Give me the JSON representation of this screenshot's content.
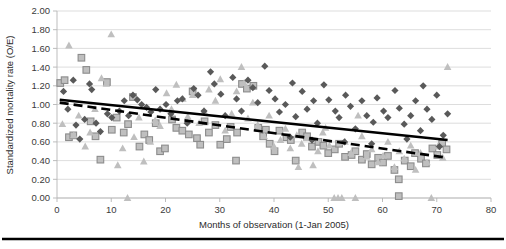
{
  "chart_data": {
    "type": "scatter",
    "title": "",
    "xlabel": "Months of observation (1-Jan 2005)",
    "ylabel": "Standardized mortality rate (O/E)",
    "xlim": [
      0,
      80
    ],
    "ylim": [
      0,
      2.0
    ],
    "xticks": [
      0,
      10,
      20,
      30,
      40,
      50,
      60,
      70,
      80
    ],
    "xtick_labels": [
      "0",
      "10",
      "20",
      "30",
      "40",
      "50",
      "60",
      "70",
      "80"
    ],
    "yticks": [
      0.0,
      0.2,
      0.4,
      0.6,
      0.8,
      1.0,
      1.2,
      1.4,
      1.6,
      1.8,
      2.0
    ],
    "ytick_labels": [
      "0.00",
      "0.20",
      "0.40",
      "0.60",
      "0.80",
      "1.00",
      "1.20",
      "1.40",
      "1.60",
      "1.80",
      "2.00"
    ],
    "grid": "horizontal",
    "legend": "none",
    "colors": {
      "diamond_fill": "#595959",
      "square_fill": "#bfbfbf",
      "square_stroke": "#8c8c8c",
      "triangle_fill": "#bfbfbf",
      "trend_solid": "#000000",
      "trend_dashed": "#000000",
      "gridline": "#d4d4d4",
      "axis": "#b5b5b5"
    },
    "series": [
      {
        "name": "series-diamond",
        "marker": "diamond",
        "points": [
          [
            1.2,
            1.14
          ],
          [
            2.0,
            0.95
          ],
          [
            3.5,
            0.78
          ],
          [
            4.2,
            0.63
          ],
          [
            5.1,
            0.84
          ],
          [
            6.4,
            1.16
          ],
          [
            7.2,
            0.8
          ],
          [
            8.0,
            0.71
          ],
          [
            9.3,
            0.9
          ],
          [
            10.1,
            0.86
          ],
          [
            11.5,
            0.93
          ],
          [
            12.4,
            1.04
          ],
          [
            13.2,
            0.88
          ],
          [
            14.0,
            1.1
          ],
          [
            14.8,
            1.05
          ],
          [
            15.6,
            1.0
          ],
          [
            16.5,
            0.97
          ],
          [
            17.3,
            0.92
          ],
          [
            18.2,
            1.16
          ],
          [
            19.0,
            0.95
          ],
          [
            20.1,
            1.0
          ],
          [
            21.0,
            0.9
          ],
          [
            22.2,
            1.04
          ],
          [
            23.1,
            1.06
          ],
          [
            24.0,
            0.8
          ],
          [
            25.2,
            1.17
          ],
          [
            26.0,
            1.1
          ],
          [
            27.1,
            0.93
          ],
          [
            28.3,
            1.35
          ],
          [
            29.0,
            1.22
          ],
          [
            30.2,
            1.11
          ],
          [
            31.0,
            0.88
          ],
          [
            32.4,
            1.29
          ],
          [
            33.1,
            1.06
          ],
          [
            34.0,
            0.93
          ],
          [
            35.2,
            1.26
          ],
          [
            36.1,
            1.18
          ],
          [
            37.0,
            1.02
          ],
          [
            38.3,
            1.41
          ],
          [
            39.1,
            1.15
          ],
          [
            40.2,
            1.06
          ],
          [
            41.0,
            0.92
          ],
          [
            42.1,
            1.0
          ],
          [
            43.4,
            1.23
          ],
          [
            44.0,
            0.87
          ],
          [
            45.2,
            1.14
          ],
          [
            46.1,
            0.95
          ],
          [
            47.3,
            1.04
          ],
          [
            48.0,
            0.8
          ],
          [
            49.2,
            1.21
          ],
          [
            50.1,
            1.05
          ],
          [
            51.3,
            0.93
          ],
          [
            52.0,
            0.86
          ],
          [
            53.2,
            1.1
          ],
          [
            54.1,
            0.98
          ],
          [
            55.0,
            0.74
          ],
          [
            56.2,
            1.04
          ],
          [
            57.1,
            0.88
          ],
          [
            58.3,
            0.81
          ],
          [
            59.0,
            1.07
          ],
          [
            60.2,
            0.93
          ],
          [
            61.0,
            0.86
          ],
          [
            62.3,
            1.15
          ],
          [
            63.1,
            0.96
          ],
          [
            64.0,
            0.79
          ],
          [
            65.2,
            0.88
          ],
          [
            66.1,
            1.04
          ],
          [
            67.0,
            0.72
          ],
          [
            68.2,
            0.95
          ],
          [
            69.1,
            0.84
          ],
          [
            70.0,
            1.1
          ],
          [
            71.2,
            0.67
          ],
          [
            72.0,
            0.9
          ],
          [
            3.0,
            1.26
          ],
          [
            6.0,
            1.22
          ],
          [
            43.0,
            0.65
          ],
          [
            47.0,
            0.62
          ],
          [
            53.0,
            0.6
          ],
          [
            58.0,
            0.58
          ],
          [
            64.5,
            0.63
          ],
          [
            67.5,
            1.2
          ],
          [
            70.5,
            0.55
          ]
        ]
      },
      {
        "name": "series-square",
        "marker": "square",
        "points": [
          [
            0.6,
            1.23
          ],
          [
            1.4,
            1.26
          ],
          [
            2.2,
            0.65
          ],
          [
            3.0,
            0.67
          ],
          [
            4.5,
            1.5
          ],
          [
            5.4,
            1.37
          ],
          [
            6.2,
            0.82
          ],
          [
            7.1,
            0.66
          ],
          [
            8.0,
            0.41
          ],
          [
            9.2,
            1.24
          ],
          [
            10.1,
            0.73
          ],
          [
            11.0,
            0.86
          ],
          [
            12.3,
            0.7
          ],
          [
            13.1,
            0.79
          ],
          [
            14.0,
            1.08
          ],
          [
            15.2,
            0.55
          ],
          [
            16.1,
            0.68
          ],
          [
            17.0,
            0.62
          ],
          [
            18.2,
            0.8
          ],
          [
            19.0,
            0.5
          ],
          [
            19.9,
            0.53
          ],
          [
            21.2,
            0.84
          ],
          [
            22.0,
            0.75
          ],
          [
            23.1,
            0.72
          ],
          [
            24.3,
            0.68
          ],
          [
            25.0,
            1.14
          ],
          [
            25.8,
            0.64
          ],
          [
            26.4,
            0.57
          ],
          [
            27.2,
            0.82
          ],
          [
            28.0,
            0.7
          ],
          [
            29.2,
            0.78
          ],
          [
            30.1,
            0.57
          ],
          [
            31.3,
            0.63
          ],
          [
            32.0,
            0.76
          ],
          [
            33.2,
            0.7
          ],
          [
            34.1,
            1.22
          ],
          [
            35.0,
            1.17
          ],
          [
            36.2,
            1.2
          ],
          [
            37.1,
            0.75
          ],
          [
            38.0,
            0.66
          ],
          [
            39.2,
            0.58
          ],
          [
            40.1,
            0.5
          ],
          [
            41.0,
            0.72
          ],
          [
            42.3,
            0.65
          ],
          [
            43.1,
            0.62
          ],
          [
            44.0,
            0.4
          ],
          [
            45.2,
            0.7
          ],
          [
            46.1,
            0.66
          ],
          [
            47.0,
            0.55
          ],
          [
            48.2,
            0.6
          ],
          [
            49.1,
            0.56
          ],
          [
            50.0,
            0.48
          ],
          [
            51.2,
            0.52
          ],
          [
            52.0,
            0.58
          ],
          [
            53.1,
            0.44
          ],
          [
            54.3,
            0.46
          ],
          [
            55.0,
            0.5
          ],
          [
            56.2,
            0.41
          ],
          [
            57.1,
            0.47
          ],
          [
            58.0,
            0.36
          ],
          [
            59.2,
            0.43
          ],
          [
            60.1,
            0.38
          ],
          [
            61.0,
            0.45
          ],
          [
            62.2,
            0.3
          ],
          [
            63.0,
            0.2
          ],
          [
            64.1,
            0.4
          ],
          [
            65.2,
            0.34
          ],
          [
            66.0,
            0.48
          ],
          [
            67.1,
            0.42
          ],
          [
            68.0,
            0.37
          ],
          [
            69.2,
            0.53
          ],
          [
            70.1,
            0.46
          ],
          [
            71.0,
            0.58
          ],
          [
            71.8,
            0.52
          ],
          [
            63.0,
            0.02
          ],
          [
            33.0,
            0.4
          ],
          [
            38.5,
            0.73
          ]
        ]
      },
      {
        "name": "series-triangle",
        "marker": "triangle",
        "points": [
          [
            1.0,
            0.79
          ],
          [
            2.2,
            1.63
          ],
          [
            3.1,
            0.67
          ],
          [
            4.0,
            0.88
          ],
          [
            5.2,
            0.55
          ],
          [
            6.1,
            0.7
          ],
          [
            7.0,
            0.95
          ],
          [
            8.2,
            1.28
          ],
          [
            9.1,
            1.22
          ],
          [
            10.0,
            1.75
          ],
          [
            11.2,
            0.35
          ],
          [
            12.1,
            0.53
          ],
          [
            13.0,
            0.0
          ],
          [
            14.2,
            0.65
          ],
          [
            15.1,
            0.86
          ],
          [
            16.0,
            0.39
          ],
          [
            17.2,
            0.6
          ],
          [
            18.1,
            0.83
          ],
          [
            19.0,
            0.77
          ],
          [
            20.2,
            1.12
          ],
          [
            21.1,
            0.95
          ],
          [
            22.0,
            1.21
          ],
          [
            23.2,
            1.06
          ],
          [
            24.1,
            0.87
          ],
          [
            25.0,
            1.1
          ],
          [
            26.2,
            0.8
          ],
          [
            27.1,
            0.93
          ],
          [
            28.0,
            1.16
          ],
          [
            29.2,
            1.04
          ],
          [
            30.1,
            1.27
          ],
          [
            31.0,
            0.72
          ],
          [
            32.2,
            0.9
          ],
          [
            33.1,
            1.14
          ],
          [
            34.0,
            1.4
          ],
          [
            35.2,
            0.85
          ],
          [
            36.1,
            1.02
          ],
          [
            37.0,
            0.78
          ],
          [
            38.2,
            0.66
          ],
          [
            39.1,
            0.88
          ],
          [
            40.0,
            0.55
          ],
          [
            41.2,
            0.62
          ],
          [
            42.1,
            0.74
          ],
          [
            43.0,
            0.53
          ],
          [
            44.2,
            0.67
          ],
          [
            45.1,
            0.58
          ],
          [
            46.0,
            0.64
          ],
          [
            47.2,
            0.35
          ],
          [
            48.1,
            0.5
          ],
          [
            49.0,
            0.7
          ],
          [
            50.2,
            0.56
          ],
          [
            51.1,
            0.0
          ],
          [
            51.8,
            0.0
          ],
          [
            52.5,
            0.0
          ],
          [
            53.1,
            0.6
          ],
          [
            54.2,
            0.48
          ],
          [
            55.0,
            0.0
          ],
          [
            56.2,
            0.66
          ],
          [
            57.1,
            0.44
          ],
          [
            58.0,
            0.52
          ],
          [
            59.2,
            0.38
          ],
          [
            60.1,
            0.45
          ],
          [
            61.0,
            0.6
          ],
          [
            62.2,
            0.33
          ],
          [
            63.1,
            0.5
          ],
          [
            64.0,
            0.42
          ],
          [
            65.2,
            0.56
          ],
          [
            66.1,
            0.3
          ],
          [
            67.0,
            0.48
          ],
          [
            68.2,
            0.38
          ],
          [
            69.0,
            0.0
          ],
          [
            70.2,
            0.55
          ],
          [
            71.1,
            0.43
          ],
          [
            72.0,
            1.4
          ],
          [
            34.5,
            1.23
          ],
          [
            44.5,
            0.33
          ],
          [
            49.5,
            0.75
          ],
          [
            55.5,
            0.88
          ]
        ]
      }
    ],
    "trendlines": [
      {
        "name": "trend-solid",
        "style": "solid",
        "x0": 0.5,
        "y0": 1.05,
        "x1": 72.0,
        "y1": 0.62
      },
      {
        "name": "trend-dashed",
        "style": "dashed",
        "x0": 0.5,
        "y0": 1.02,
        "x1": 72.0,
        "y1": 0.43
      }
    ]
  }
}
